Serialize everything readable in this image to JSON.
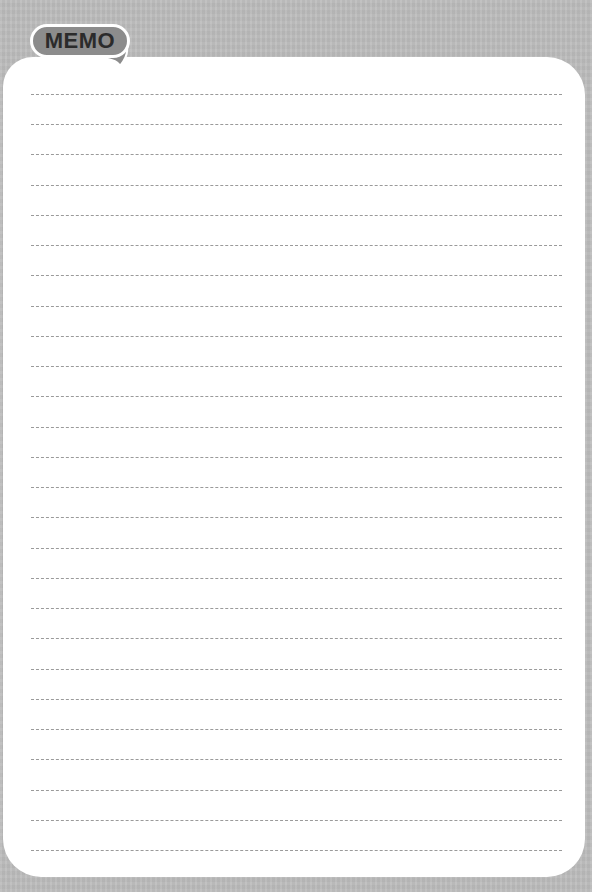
{
  "memo": {
    "tab_label": "MEMO",
    "line_count": 26,
    "colors": {
      "background": "#bdbdbd",
      "card": "#ffffff",
      "tab_fill": "#8c8c8c",
      "tab_text": "#2b2b2b",
      "rule": "#9a9a9a"
    }
  }
}
